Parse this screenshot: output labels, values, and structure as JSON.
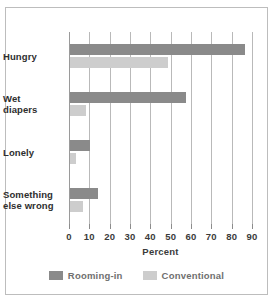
{
  "chart_data": {
    "type": "bar",
    "orientation": "horizontal",
    "title": "",
    "xlabel": "Percent",
    "ylabel": "",
    "xlim": [
      0,
      90
    ],
    "xticks": [
      0,
      10,
      20,
      30,
      40,
      50,
      60,
      70,
      80,
      90
    ],
    "grid": true,
    "legend_position": "bottom",
    "categories": [
      "Hungry",
      "Wet diapers",
      "Lonely",
      "Something else wrong"
    ],
    "series": [
      {
        "name": "Rooming-in",
        "color": "#8a8a8a",
        "values": [
          86,
          57,
          10,
          14
        ]
      },
      {
        "name": "Conventional",
        "color": "#cdcdcd",
        "values": [
          48,
          8,
          3,
          6.5
        ]
      }
    ]
  },
  "colors": {
    "rooming_in": "#8a8a8a",
    "conventional": "#cdcdcd",
    "grid": "#b9b9b9",
    "frame": "#bdbdbd",
    "text": "#2e2e2e",
    "legend_text": "#6f6f6f"
  }
}
